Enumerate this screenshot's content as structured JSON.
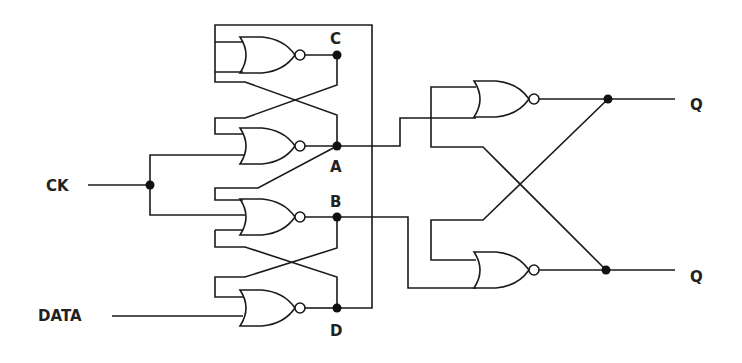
{
  "labels": {
    "clock_input": "CK",
    "data_input": "DATA",
    "node_c": "C",
    "node_a": "A",
    "node_b": "B",
    "node_d": "D",
    "output_q": "Q",
    "output_q_bar": "Q"
  },
  "components": {
    "gate_type": "NOR",
    "gate_count": 6,
    "gates": [
      {
        "id": "nor-1",
        "output": "C"
      },
      {
        "id": "nor-2",
        "output": "A"
      },
      {
        "id": "nor-3",
        "output": "B"
      },
      {
        "id": "nor-4",
        "output": "D"
      },
      {
        "id": "nor-5",
        "output": "Q"
      },
      {
        "id": "nor-6",
        "output": "Q-bar"
      }
    ]
  },
  "colors": {
    "ink": "#1a1a1a",
    "background": "#ffffff"
  }
}
